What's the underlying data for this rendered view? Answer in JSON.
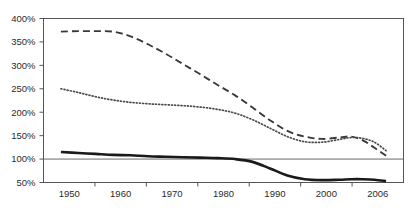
{
  "chart_data": {
    "type": "line",
    "title": "",
    "subtitle": "",
    "xlabel": "",
    "ylabel": "",
    "grid": "horizontal-gridline-at-100",
    "legend_position": "none",
    "xlim": [
      1947,
      2009
    ],
    "ylim": [
      50,
      400
    ],
    "y_ticks": [
      50,
      100,
      150,
      200,
      250,
      300,
      350,
      400
    ],
    "y_tick_labels": [
      "50%",
      "100%",
      "150%",
      "200%",
      "250%",
      "300%",
      "350%",
      "400%"
    ],
    "x_tick_labels": [
      "1950",
      "1960",
      "1970",
      "1980",
      "1990",
      "2000",
      "2006"
    ],
    "x_tick_values": [
      1950,
      1960,
      1970,
      1980,
      1990,
      2000,
      2006
    ],
    "gridline_values": [
      100
    ],
    "series": [
      {
        "name": "dashed-series",
        "style": "dashed",
        "color": "#3a3a3a",
        "width": 1.9,
        "x": [
          1950,
          1953,
          1956,
          1959,
          1962,
          1965,
          1968,
          1971,
          1974,
          1977,
          1980,
          1983,
          1986,
          1989,
          1992,
          1995,
          1998,
          2000,
          2002,
          2004,
          2006
        ],
        "values": [
          372,
          373,
          373,
          372,
          362,
          345,
          325,
          303,
          281,
          258,
          236,
          210,
          183,
          160,
          148,
          143,
          146,
          148,
          140,
          124,
          107
        ]
      },
      {
        "name": "dotted-series",
        "style": "dotted",
        "color": "#4a4a4a",
        "width": 1.7,
        "x": [
          1950,
          1953,
          1956,
          1959,
          1962,
          1965,
          1968,
          1971,
          1974,
          1977,
          1980,
          1983,
          1986,
          1989,
          1992,
          1995,
          1998,
          2000,
          2002,
          2004,
          2006
        ],
        "values": [
          250,
          242,
          233,
          226,
          221,
          218,
          216,
          214,
          211,
          206,
          198,
          184,
          166,
          148,
          137,
          136,
          142,
          146,
          144,
          136,
          118
        ]
      },
      {
        "name": "solid-series",
        "style": "solid",
        "color": "#1a1a1a",
        "width": 2.6,
        "x": [
          1950,
          1953,
          1956,
          1959,
          1962,
          1965,
          1968,
          1971,
          1974,
          1977,
          1980,
          1983,
          1986,
          1989,
          1992,
          1995,
          1998,
          2000,
          2002,
          2004,
          2006
        ],
        "values": [
          115,
          113,
          111,
          109,
          108,
          106,
          105,
          104,
          103,
          102,
          100,
          94,
          80,
          65,
          57,
          55,
          56,
          57,
          57,
          56,
          53
        ]
      }
    ],
    "colors": {
      "axis": "#555555",
      "gridline": "#6b6b6b",
      "plot_border": "#555555",
      "text": "#2b2b2b",
      "background": "#ffffff"
    }
  }
}
